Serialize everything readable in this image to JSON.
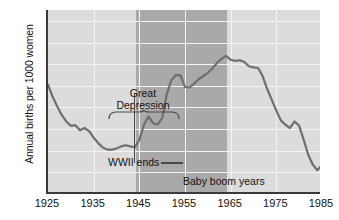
{
  "chart_data": {
    "type": "line",
    "title": "",
    "xlabel": "",
    "ylabel": "Annual births per 1000 women",
    "xlim": [
      1925,
      1985
    ],
    "ylim": [
      60,
      145
    ],
    "yticks": [
      60,
      70,
      80,
      90,
      100,
      110,
      120,
      130,
      140
    ],
    "xticks": [
      1925,
      1935,
      1945,
      1955,
      1965,
      1975,
      1985
    ],
    "grid": true,
    "legend": "none",
    "series": [
      {
        "name": "Annual births per 1000 women",
        "x": [
          1925,
          1926,
          1927,
          1928,
          1929,
          1930,
          1931,
          1932,
          1933,
          1934,
          1935,
          1936,
          1937,
          1938,
          1939,
          1940,
          1941,
          1942,
          1943,
          1944,
          1945,
          1946,
          1947,
          1948,
          1949,
          1950,
          1951,
          1952,
          1953,
          1954,
          1955,
          1956,
          1957,
          1958,
          1959,
          1960,
          1961,
          1962,
          1963,
          1964,
          1965,
          1966,
          1967,
          1968,
          1969,
          1970,
          1971,
          1972,
          1973,
          1974,
          1975,
          1976,
          1977,
          1978,
          1979,
          1980,
          1981,
          1982,
          1983,
          1984,
          1985
        ],
        "values": [
          110.5,
          105.0,
          100.5,
          96.5,
          93.5,
          91.5,
          91.8,
          89.5,
          90.5,
          89.0,
          86.0,
          83.5,
          81.5,
          80.5,
          80.5,
          81.0,
          82.0,
          82.5,
          82.0,
          81.5,
          85.0,
          92.0,
          95.8,
          92.8,
          92.0,
          95.0,
          106.0,
          112.5,
          115.0,
          114.8,
          109.5,
          109.2,
          111.0,
          113.0,
          114.5,
          116.0,
          118.0,
          120.5,
          122.5,
          123.8,
          122.0,
          121.5,
          121.8,
          121.0,
          119.0,
          118.5,
          118.2,
          114.5,
          108.5,
          103.5,
          98.5,
          94.0,
          92.0,
          90.5,
          93.5,
          91.5,
          85.0,
          78.0,
          73.5,
          71.0,
          73.5
        ],
        "color": "#6e6e6e"
      }
    ],
    "shaded_bands": [
      {
        "name": "baby-boom-band",
        "x_start": 1945,
        "x_end": 1965,
        "color": "#a9a9a9"
      },
      {
        "name": "plot-background",
        "color": "#dcdcdc"
      }
    ],
    "annotations": [
      {
        "name": "great-depression",
        "text_line1": "Great",
        "text_line2": "Depression",
        "x_start": 1930,
        "x_end": 1940
      },
      {
        "name": "wwii-ends",
        "text": "WWII ends",
        "x": 1945
      },
      {
        "name": "baby-boom-years",
        "text": "Baby boom years",
        "x_start": 1945,
        "x_end": 1965
      }
    ]
  },
  "axes": {
    "y_title": "Annual births per 1000 women",
    "y_ticks": [
      "140",
      "130",
      "120",
      "110",
      "100",
      "90",
      "80",
      "70",
      "60"
    ],
    "x_ticks": [
      "1925",
      "1935",
      "1945",
      "1955",
      "1965",
      "1975",
      "1985"
    ]
  },
  "annotations": {
    "depression_line1": "Great",
    "depression_line2": "Depression",
    "wwii": "WWII ends",
    "baby_boom": "Baby boom years"
  },
  "colors": {
    "plot_background": "#dcdcdc",
    "band_highlight": "#a9a9a9",
    "line": "#6e6e6e",
    "axis": "#3a3a3a",
    "gridline": "#f4f4f4",
    "text": "#111111"
  }
}
